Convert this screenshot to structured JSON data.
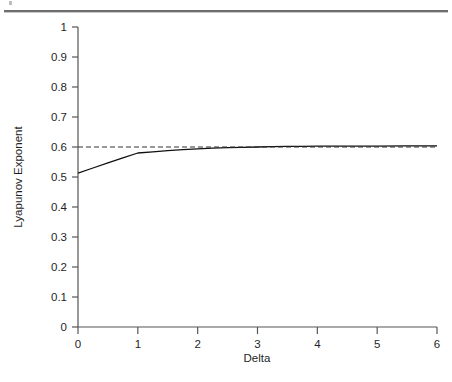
{
  "page": {
    "rule_color": "#6e6e6e",
    "background": "#ffffff"
  },
  "figure": {
    "y_axis_title": "Lyapunov Exponent",
    "x_axis_title": "Delta"
  },
  "chart_data": {
    "type": "line",
    "title": "",
    "subtitle": "",
    "xlabel": "Delta",
    "ylabel": "Lyapunov Exponent",
    "xlim": [
      0,
      6
    ],
    "ylim": [
      0,
      1
    ],
    "xticks": [
      0,
      1,
      2,
      3,
      4,
      5,
      6
    ],
    "xtick_labels": [
      "0",
      "1",
      "2",
      "3",
      "4",
      "5",
      "6"
    ],
    "yticks": [
      0,
      0.1,
      0.2,
      0.3,
      0.4,
      0.5,
      0.6,
      0.7,
      0.8,
      0.9,
      1
    ],
    "ytick_labels": [
      "0",
      "0.1",
      "0.2",
      "0.3",
      "0.4",
      "0.5",
      "0.6",
      "0.7",
      "0.8",
      "0.9",
      "1"
    ],
    "grid": false,
    "legend": null,
    "legend_position": "none",
    "axis_color": "#555555",
    "series": [
      {
        "name": "Lyapunov exponent",
        "style": "solid",
        "color": "#111111",
        "width": 1.3,
        "x": [
          0,
          0.25,
          0.5,
          0.75,
          1,
          1.25,
          1.5,
          1.75,
          2,
          2.25,
          2.5,
          2.75,
          3,
          3.25,
          3.5,
          3.75,
          4,
          4.5,
          5,
          5.5,
          6
        ],
        "y": [
          0.513,
          0.53,
          0.547,
          0.564,
          0.58,
          0.584,
          0.588,
          0.591,
          0.594,
          0.596,
          0.598,
          0.599,
          0.6,
          0.601,
          0.602,
          0.602,
          0.603,
          0.603,
          0.603,
          0.604,
          0.604
        ]
      },
      {
        "name": "Asymptotic reference",
        "style": "dashed",
        "color": "#333333",
        "width": 1.1,
        "x": [
          0,
          6
        ],
        "y": [
          0.6,
          0.6
        ]
      }
    ],
    "annotations": [
      {
        "text": "solid curve rises from 0.513 at Delta = 0 to a knee near 0.58 at Delta = 1, then approaches the dashed asymptote at 0.6",
        "x": 1,
        "y": 0.58
      }
    ]
  }
}
